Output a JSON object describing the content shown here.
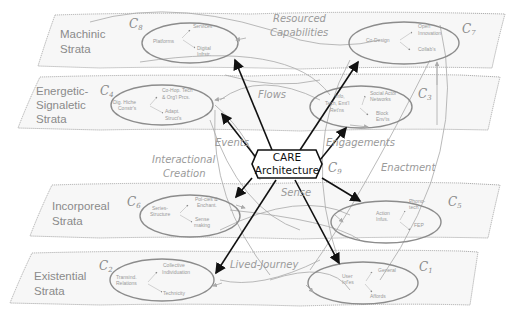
{
  "title": "CARE Architecture",
  "center": {
    "line1": "CARE",
    "line2": "Architecture",
    "label": "C",
    "sub": "9"
  },
  "strata": [
    {
      "id": "machinic",
      "line1": "Machinic",
      "line2": "Strata",
      "line3": ""
    },
    {
      "id": "energetic",
      "line1": "Energetic-",
      "line2": "Signaletic",
      "line3": "Strata"
    },
    {
      "id": "incorporeal",
      "line1": "Incorporeal",
      "line2": "Strata",
      "line3": ""
    },
    {
      "id": "existential",
      "line1": "Existential",
      "line2": "Strata",
      "line3": ""
    }
  ],
  "clusters": {
    "c8": {
      "label": "C",
      "sub": "8",
      "nodes": [
        "Platforms",
        "Services",
        "Digital",
        "Infrstr."
      ]
    },
    "c7": {
      "label": "C",
      "sub": "7",
      "nodes": [
        "Co-Design",
        "Open",
        "Innovation",
        "Collab's"
      ]
    },
    "c4": {
      "label": "C",
      "sub": "4",
      "nodes": [
        "Dig. Hiche",
        "Constr's",
        "Co-Hop. Tech",
        "& Org'l Prcs.",
        "Adapt.",
        "Struct's"
      ]
    },
    "c3": {
      "label": "C",
      "sub": "3",
      "nodes": [
        "Info,",
        "Tech, Emt'l",
        "Ret'ns",
        "Social Actor",
        "Networks",
        "Block",
        "Env'ts"
      ]
    },
    "c6": {
      "label": "C",
      "sub": "6",
      "nodes": [
        "Series-",
        "Structure",
        "Pol-cies &",
        "Enchant.",
        "Sense",
        "making"
      ]
    },
    "c5": {
      "label": "C",
      "sub": "5",
      "nodes": [
        "Action",
        "Infus.",
        "Phono-",
        "tech",
        "FEP"
      ]
    },
    "c2": {
      "label": "C",
      "sub": "2",
      "nodes": [
        "Transind.",
        "Relations",
        "Collective",
        "Individuation",
        "Technicity"
      ]
    },
    "c1": {
      "label": "C",
      "sub": "1",
      "nodes": [
        "User",
        "Inf'es",
        "General",
        "Affords"
      ]
    }
  },
  "flows": {
    "resourced": "Resourced",
    "capabilities": "Capabilities",
    "flows": "Flows",
    "events": "Events",
    "engagements": "Engagements",
    "interactional": "Interactional",
    "creation": "Creation",
    "enactment": "Enactment",
    "sense": "Sense",
    "lived_journey": "Lived-Journey"
  },
  "colors": {
    "strata_border": "#9a9a9a",
    "ellipse": "#8c8c8c",
    "arrow": "#111111",
    "text": "#8a8a8a"
  }
}
